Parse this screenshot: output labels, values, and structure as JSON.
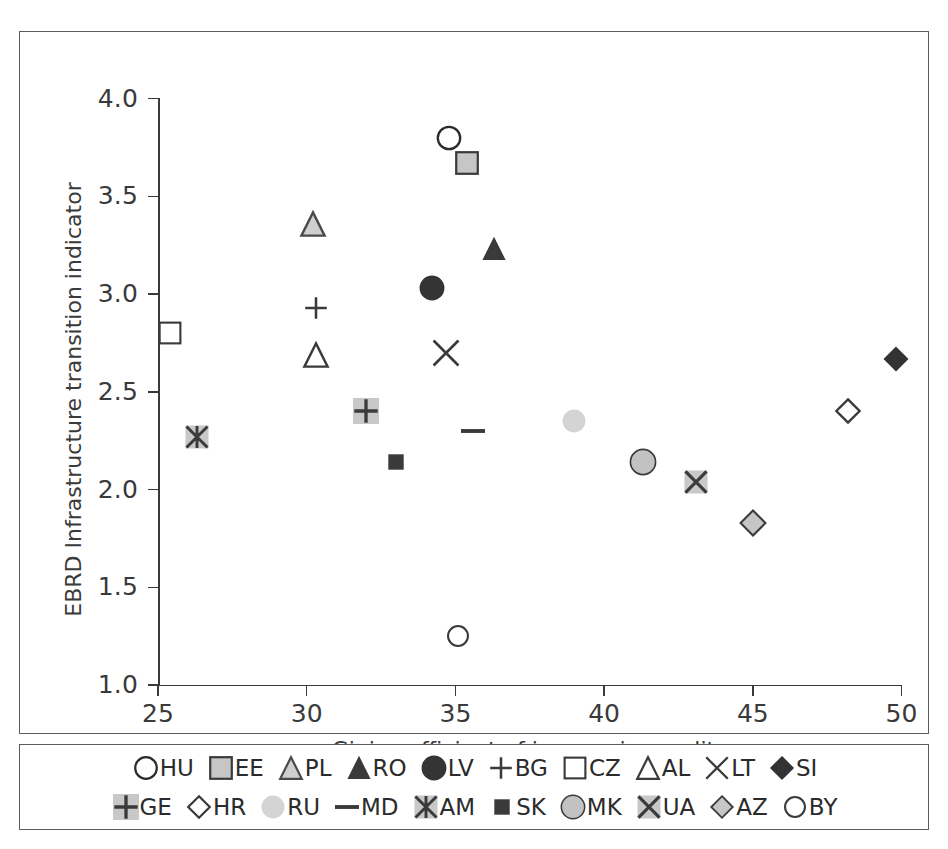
{
  "chart_data": {
    "type": "scatter",
    "title": "",
    "xlabel": "Gini coefficient of income inequality",
    "ylabel": "EBRD Infrastructure transition indicator",
    "xlim": [
      25,
      50
    ],
    "ylim": [
      1.0,
      4.0
    ],
    "xticks": [
      "25",
      "30",
      "35",
      "40",
      "45",
      "50"
    ],
    "yticks": [
      "1.0",
      "1.5",
      "2.0",
      "2.5",
      "3.0",
      "3.5",
      "4.0"
    ],
    "grid": false,
    "legend_position": "bottom",
    "points": [
      {
        "label": "HU",
        "x": 34.8,
        "y": 3.8,
        "marker": "circle-open",
        "fill": "#ffffff",
        "stroke": "#2b2b2b",
        "size": 27
      },
      {
        "label": "EE",
        "x": 35.4,
        "y": 3.67,
        "marker": "square-filled",
        "fill": "#c6c6c6",
        "stroke": "#3a3a3a",
        "size": 26
      },
      {
        "label": "PL",
        "x": 30.2,
        "y": 3.36,
        "marker": "triangle-filled",
        "fill": "#cfcfcf",
        "stroke": "#4a4a4a",
        "size": 28
      },
      {
        "label": "RO",
        "x": 36.3,
        "y": 3.23,
        "marker": "triangle-filled",
        "fill": "#3a3a3a",
        "stroke": "#3a3a3a",
        "size": 24
      },
      {
        "label": "LV",
        "x": 34.2,
        "y": 3.03,
        "marker": "circle-filled",
        "fill": "#343434",
        "stroke": "#343434",
        "size": 26
      },
      {
        "label": "BG",
        "x": 30.3,
        "y": 2.93,
        "marker": "plus",
        "fill": "none",
        "stroke": "#3a3a3a",
        "size": 26
      },
      {
        "label": "CZ",
        "x": 25.4,
        "y": 2.8,
        "marker": "square-open",
        "fill": "#ffffff",
        "stroke": "#3a3a3a",
        "size": 25
      },
      {
        "label": "AL",
        "x": 30.3,
        "y": 2.69,
        "marker": "triangle-open",
        "fill": "#ffffff",
        "stroke": "#3a3a3a",
        "size": 28
      },
      {
        "label": "LT",
        "x": 34.7,
        "y": 2.7,
        "marker": "x-cross",
        "fill": "none",
        "stroke": "#3a3a3a",
        "size": 30
      },
      {
        "label": "SI",
        "x": 49.8,
        "y": 2.67,
        "marker": "diamond-filled",
        "fill": "#333333",
        "stroke": "#333333",
        "size": 27
      },
      {
        "label": "GE",
        "x": 32.0,
        "y": 2.4,
        "marker": "plus-boxed",
        "fill": "#c8c8c8",
        "stroke": "#3a3a3a",
        "size": 26
      },
      {
        "label": "HR",
        "x": 48.2,
        "y": 2.4,
        "marker": "diamond-open",
        "fill": "#ffffff",
        "stroke": "#3a3a3a",
        "size": 28
      },
      {
        "label": "RU",
        "x": 39.0,
        "y": 2.35,
        "marker": "circle-filled",
        "fill": "#d4d4d4",
        "stroke": "#d4d4d4",
        "size": 24
      },
      {
        "label": "MD",
        "x": 35.6,
        "y": 2.3,
        "marker": "dash",
        "fill": "#3a3a3a",
        "stroke": "#3a3a3a",
        "size": 24
      },
      {
        "label": "AM",
        "x": 26.3,
        "y": 2.27,
        "marker": "asterisk-boxed",
        "fill": "#c8c8c8",
        "stroke": "#3a3a3a",
        "size": 23
      },
      {
        "label": "SK",
        "x": 33.0,
        "y": 2.14,
        "marker": "square-filled",
        "fill": "#3a3a3a",
        "stroke": "#3a3a3a",
        "size": 17
      },
      {
        "label": "MK",
        "x": 41.3,
        "y": 2.14,
        "marker": "circle-filled",
        "fill": "#c2c2c2",
        "stroke": "#3a3a3a",
        "size": 28
      },
      {
        "label": "UA",
        "x": 43.1,
        "y": 2.04,
        "marker": "x-boxed",
        "fill": "#c8c8c8",
        "stroke": "#3a3a3a",
        "size": 23
      },
      {
        "label": "AZ",
        "x": 45.0,
        "y": 1.83,
        "marker": "diamond-filled",
        "fill": "#c6c6c6",
        "stroke": "#3a3a3a",
        "size": 30
      },
      {
        "label": "BY",
        "x": 35.1,
        "y": 1.25,
        "marker": "circle-open",
        "fill": "#ffffff",
        "stroke": "#3a3a3a",
        "size": 24
      }
    ]
  },
  "legend": {
    "rows": [
      [
        "HU",
        "EE",
        "PL",
        "RO",
        "LV",
        "BG",
        "CZ",
        "AL",
        "LT",
        "SI"
      ],
      [
        "GE",
        "HR",
        "RU",
        "MD",
        "AM",
        "SK",
        "MK",
        "UA",
        "AZ",
        "BY"
      ]
    ]
  }
}
